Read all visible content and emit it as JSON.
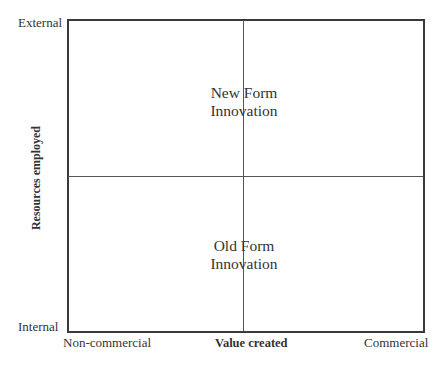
{
  "diagram": {
    "type": "2x2 matrix",
    "y_axis": {
      "title": "Resources employed",
      "top_label": "External",
      "bottom_label": "Internal"
    },
    "x_axis": {
      "title": "Value created",
      "left_label": "Non-commercial",
      "right_label": "Commercial"
    },
    "quadrant_labels": {
      "upper": {
        "line1": "New Form",
        "line2": "Innovation"
      },
      "lower": {
        "line1": "Old Form",
        "line2": "Innovation"
      }
    },
    "colors": {
      "line": "#3a3a3a",
      "text": "#333333",
      "background": "#ffffff"
    }
  }
}
